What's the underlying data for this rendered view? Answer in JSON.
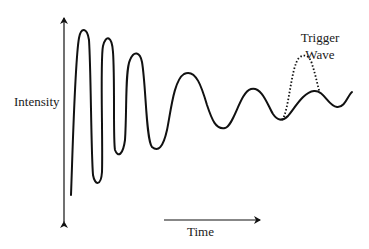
{
  "diagram": {
    "type": "damped-oscillation-with-trigger",
    "y_axis": {
      "label": "Intensity",
      "bidirectional_arrow": true
    },
    "x_axis": {
      "label": "Time",
      "arrow_direction": "right"
    },
    "annotations": {
      "trigger_wave_line1": "Trigger",
      "trigger_wave_line2": "Wave"
    },
    "series": {
      "main_wave": {
        "style": "solid",
        "color": "#111111",
        "description": "Damped oscillation: large-amplitude, high-frequency at start, decaying amplitude and increasing period over time"
      },
      "trigger_wave": {
        "style": "dotted",
        "color": "#111111",
        "description": "Single dotted pulse rising from a trough of the main wave near the end"
      }
    },
    "colors": {
      "ink": "#111111",
      "background": "#ffffff"
    }
  }
}
